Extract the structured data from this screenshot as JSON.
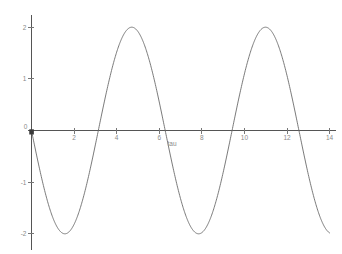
{
  "figure": {
    "background_color": "#ffffff",
    "curve_color": "#6b6b6b",
    "axis_color": "#555555",
    "label_color": "#8a8a8a",
    "width": 342,
    "height": 254
  },
  "chart_data": {
    "type": "line",
    "title": "",
    "xlabel": "tau",
    "ylabel": "",
    "xlim": [
      -0.35,
      14.3
    ],
    "ylim": [
      -2.12,
      2.12
    ],
    "grid": false,
    "legend": null,
    "x_ticks": [
      2,
      4,
      6,
      8,
      10,
      12,
      14
    ],
    "x_tick_labels": [
      "2",
      "4",
      "6",
      "8",
      "10",
      "12",
      "14"
    ],
    "y_ticks": [
      -2,
      -1,
      0,
      1,
      2
    ],
    "y_tick_labels": [
      "-2",
      "-1",
      "0",
      "1",
      "2"
    ],
    "origin_label": "0",
    "annotations": [],
    "series": [
      {
        "name": "curve",
        "description": "sinusoid of amplitude 2, period about 6.3, starting at 0 and descending",
        "amplitude": 2.0,
        "period": 6.28,
        "phase": 0.0,
        "x": [
          0.0,
          0.2,
          0.4,
          0.6,
          0.8,
          1.0,
          1.1,
          1.2,
          1.4,
          1.6,
          1.8,
          2.0,
          2.2,
          2.4,
          2.6,
          2.8,
          3.0,
          3.2,
          3.4,
          3.6,
          3.8,
          4.0,
          4.2,
          4.4,
          4.6,
          4.8,
          5.0,
          5.2,
          5.4,
          5.6,
          5.8,
          6.0,
          6.2,
          6.4,
          6.6,
          6.8,
          7.0,
          7.2,
          7.4,
          7.6,
          7.8,
          8.0,
          8.2,
          8.4,
          8.6,
          8.8,
          9.0,
          9.2,
          9.4,
          9.6,
          9.8,
          10.0,
          10.2,
          10.4,
          10.6,
          10.8,
          11.0,
          11.2,
          11.4,
          11.6,
          11.8,
          12.0,
          12.2,
          12.4,
          12.6,
          12.8,
          13.0,
          13.2,
          13.4,
          13.6,
          13.8,
          14.0
        ],
        "y": [
          0.0,
          -0.397,
          -0.779,
          -1.129,
          -1.434,
          -1.683,
          -1.783,
          -1.864,
          -1.97,
          -2.0,
          -1.947,
          -1.819,
          -1.617,
          -1.352,
          -1.031,
          -0.674,
          -0.282,
          0.116,
          0.506,
          0.881,
          1.211,
          1.514,
          1.744,
          1.908,
          1.993,
          1.991,
          1.918,
          1.755,
          1.532,
          1.25,
          0.912,
          0.559,
          0.166,
          -0.232,
          -0.616,
          -0.978,
          -1.314,
          -1.589,
          -1.801,
          -1.944,
          -2.0,
          -1.978,
          -1.872,
          -1.692,
          -1.444,
          -1.141,
          -0.824,
          -0.446,
          -0.058,
          0.335,
          0.713,
          1.063,
          1.377,
          1.631,
          1.823,
          1.95,
          1.999,
          1.964,
          1.849,
          1.654,
          1.4,
          1.086,
          0.735,
          0.357,
          -0.041,
          -0.427,
          -0.795,
          -1.198,
          -1.509,
          -1.757,
          -1.923,
          -1.996
        ]
      }
    ]
  }
}
